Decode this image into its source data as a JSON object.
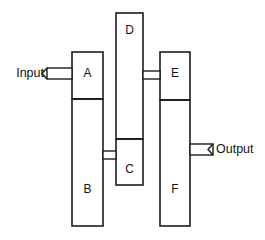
{
  "diagram": {
    "type": "block-diagram",
    "colors": {
      "stroke": "#1c1c1c",
      "fill": "#ffffff",
      "text": "#141414",
      "background": "#ffffff"
    },
    "blocks": [
      {
        "id": "A",
        "label": "A",
        "x": 72,
        "y": 52,
        "w": 31,
        "h": 47,
        "label_x": 87.5,
        "label_y": 74
      },
      {
        "id": "B",
        "label": "B",
        "x": 72,
        "y": 99,
        "w": 31,
        "h": 127,
        "label_x": 87.5,
        "label_y": 190
      },
      {
        "id": "D",
        "label": "D",
        "x": 116,
        "y": 13,
        "w": 27,
        "h": 126,
        "label_x": 129.5,
        "label_y": 31
      },
      {
        "id": "C",
        "label": "C",
        "x": 116,
        "y": 139,
        "w": 27,
        "h": 46,
        "label_x": 129.5,
        "label_y": 170
      },
      {
        "id": "E",
        "label": "E",
        "x": 160,
        "y": 52,
        "w": 30,
        "h": 48,
        "label_x": 175,
        "label_y": 74
      },
      {
        "id": "F",
        "label": "F",
        "x": 160,
        "y": 100,
        "w": 30,
        "h": 126,
        "label_x": 175,
        "label_y": 190
      }
    ],
    "dividers": [
      {
        "id": "A-B",
        "x1": 72,
        "x2": 103,
        "y": 99
      },
      {
        "id": "D-C",
        "x1": 116,
        "x2": 143,
        "y": 139
      },
      {
        "id": "E-F",
        "x1": 160,
        "x2": 190,
        "y": 100
      }
    ],
    "links": [
      {
        "id": "D-E",
        "from": "D",
        "to": "E",
        "x": 143,
        "y": 71,
        "w": 17,
        "h": 8
      },
      {
        "id": "B-C",
        "from": "B",
        "to": "C",
        "x": 103,
        "y": 151,
        "w": 13,
        "h": 8
      }
    ],
    "ports": [
      {
        "id": "input",
        "label": "Input",
        "side": "left",
        "connects_to": "A",
        "rect_x": 47,
        "rect_y": 68,
        "rect_w": 25,
        "rect_h": 11,
        "label_x": 44,
        "label_y": 74
      },
      {
        "id": "output",
        "label": "Output",
        "side": "right",
        "connects_from": "F",
        "rect_x": 190,
        "rect_y": 144,
        "rect_w": 23,
        "rect_h": 11,
        "label_x": 216,
        "label_y": 150
      }
    ]
  }
}
